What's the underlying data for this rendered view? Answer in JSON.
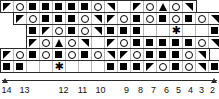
{
  "chart_data": {
    "type": "table",
    "grid": {
      "cell_size_px": 13,
      "total_columns": 16,
      "total_rows": 6,
      "reading_direction": "right-to-left"
    },
    "symbol_legend": [
      {
        "key": "square",
        "name": "filled-square",
        "glyph": "■"
      },
      {
        "key": "circle",
        "name": "open-circle",
        "glyph": "○"
      },
      {
        "key": "tri_dl",
        "name": "triangle-down-left",
        "glyph": "◢"
      },
      {
        "key": "tri_dr",
        "name": "triangle-down-right",
        "glyph": "◣"
      },
      {
        "key": "tri_up",
        "name": "triangle-up",
        "glyph": "▲"
      },
      {
        "key": "asterisk",
        "name": "asterisk-special",
        "glyph": "✱"
      },
      {
        "key": "blank",
        "name": "empty-cell",
        "glyph": ""
      }
    ],
    "rows": [
      {
        "id": "row-1",
        "left_px": 0,
        "top_px": 0,
        "cells": [
          "tri_dl",
          "circle",
          "square",
          "square",
          "square",
          "square",
          "square",
          "circle",
          "tri_dr",
          "blank",
          "tri_dl",
          "circle",
          "tri_up",
          "circle",
          "tri_dr"
        ]
      },
      {
        "id": "row-2",
        "left_px": 13,
        "top_px": 12,
        "cells": [
          "tri_dl",
          "circle",
          "square",
          "square",
          "square",
          "circle",
          "tri_dr",
          "tri_dl",
          "circle",
          "square",
          "circle",
          "square",
          "circle",
          "square",
          "circle",
          "tri_dr"
        ]
      },
      {
        "id": "row-3",
        "left_px": 26,
        "top_px": 24,
        "cells": [
          "square",
          "tri_dl",
          "circle",
          "square",
          "circle",
          "tri_dr",
          "square",
          "square",
          "square",
          "blank",
          "blank",
          "asterisk",
          "blank",
          "blank",
          "square",
          "square"
        ]
      },
      {
        "id": "row-4",
        "left_px": 26,
        "top_px": 36,
        "cells": [
          "tri_dl",
          "circle",
          "tri_up",
          "circle",
          "tri_dr",
          "blank",
          "tri_dl",
          "circle",
          "square",
          "square",
          "square",
          "square",
          "square",
          "circle",
          "tri_dr"
        ]
      },
      {
        "id": "row-5",
        "left_px": 0,
        "top_px": 48,
        "cells": [
          "tri_dl",
          "circle",
          "square",
          "circle",
          "square",
          "circle",
          "square",
          "circle",
          "tri_dr",
          "tri_dl",
          "circle",
          "square",
          "square",
          "square",
          "circle",
          "tri_dr"
        ]
      },
      {
        "id": "row-6",
        "left_px": 0,
        "top_px": 60,
        "cells": [
          "square",
          "square",
          "blank",
          "blank",
          "asterisk",
          "blank",
          "blank",
          "blank",
          "square",
          "square",
          "square",
          "tri_dl",
          "circle",
          "square",
          "circle",
          "tri_dr",
          "square"
        ]
      }
    ],
    "axis": {
      "orientation": "horizontal",
      "position": "bottom",
      "direction": "right-to-left",
      "labels": [
        {
          "text": "14",
          "left_px": 6
        },
        {
          "text": "13",
          "left_px": 24
        },
        {
          "text": "12",
          "left_px": 63
        },
        {
          "text": "11",
          "left_px": 82
        },
        {
          "text": "10",
          "left_px": 100
        },
        {
          "text": "9",
          "left_px": 126
        },
        {
          "text": "8",
          "left_px": 140
        },
        {
          "text": "7",
          "left_px": 153
        },
        {
          "text": "6",
          "left_px": 166
        },
        {
          "text": "5",
          "left_px": 178
        },
        {
          "text": "4",
          "left_px": 190
        },
        {
          "text": "3",
          "left_px": 201
        },
        {
          "text": "2",
          "left_px": 212
        },
        {
          "text": "1",
          "left_px": 224
        }
      ]
    },
    "colors": {
      "symbol": "#000000",
      "grid_outer": "#2b2b2b",
      "grid_inner": "#b9b9b9",
      "background": "#ffffff",
      "axis_text": "#111111"
    }
  }
}
